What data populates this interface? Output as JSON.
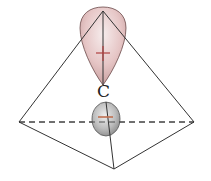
{
  "diagram": {
    "type": "sp3 hybrid orbital in tetrahedron",
    "atom_label": "C",
    "upper_lobe": {
      "sign": "+",
      "fill": "#e9c9c9",
      "stroke": "#6b4a4a",
      "sign_color": "#b04040"
    },
    "lower_lobe": {
      "sign": "−",
      "fill": "#b9b9b9",
      "stroke": "#555555",
      "sign_color": "#c07050"
    },
    "tetrahedron": {
      "apex": [
        103,
        11
      ],
      "left": [
        19,
        122
      ],
      "right": [
        194,
        122
      ],
      "bottom": [
        114,
        169
      ],
      "edge_color": "#333333"
    }
  }
}
